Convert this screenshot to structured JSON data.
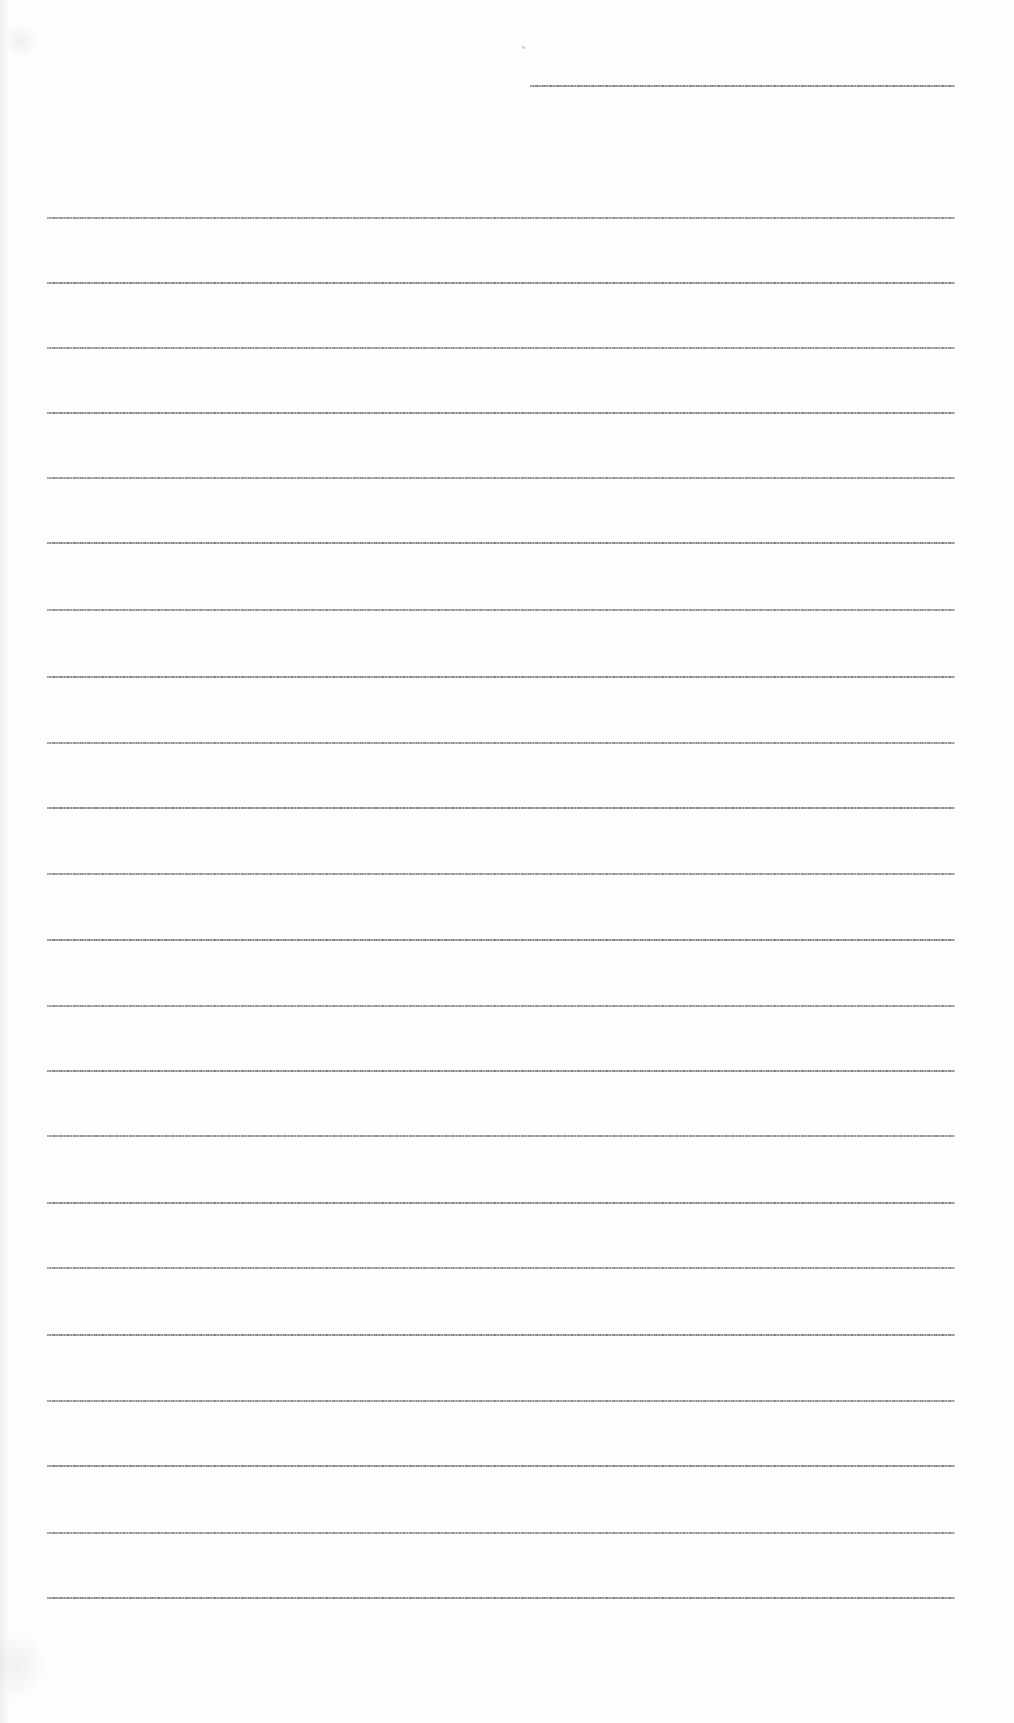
{
  "document": {
    "kind": "scanned-blank-ruled-page",
    "paper_color": "#fdfdfc",
    "rule_color": "#8a8a8a",
    "text_content": "",
    "header_line": {
      "x": 530,
      "y": 85,
      "width": 425
    },
    "ruled_lines": {
      "x": 47,
      "width": 908,
      "y_positions": [
        217,
        282,
        347,
        412,
        477,
        542,
        609,
        676,
        742,
        807,
        873,
        939,
        1005,
        1070,
        1135,
        1202,
        1267,
        1334,
        1400,
        1465,
        1532,
        1597
      ]
    },
    "specks": [
      {
        "x": 522,
        "y": 46
      }
    ]
  }
}
